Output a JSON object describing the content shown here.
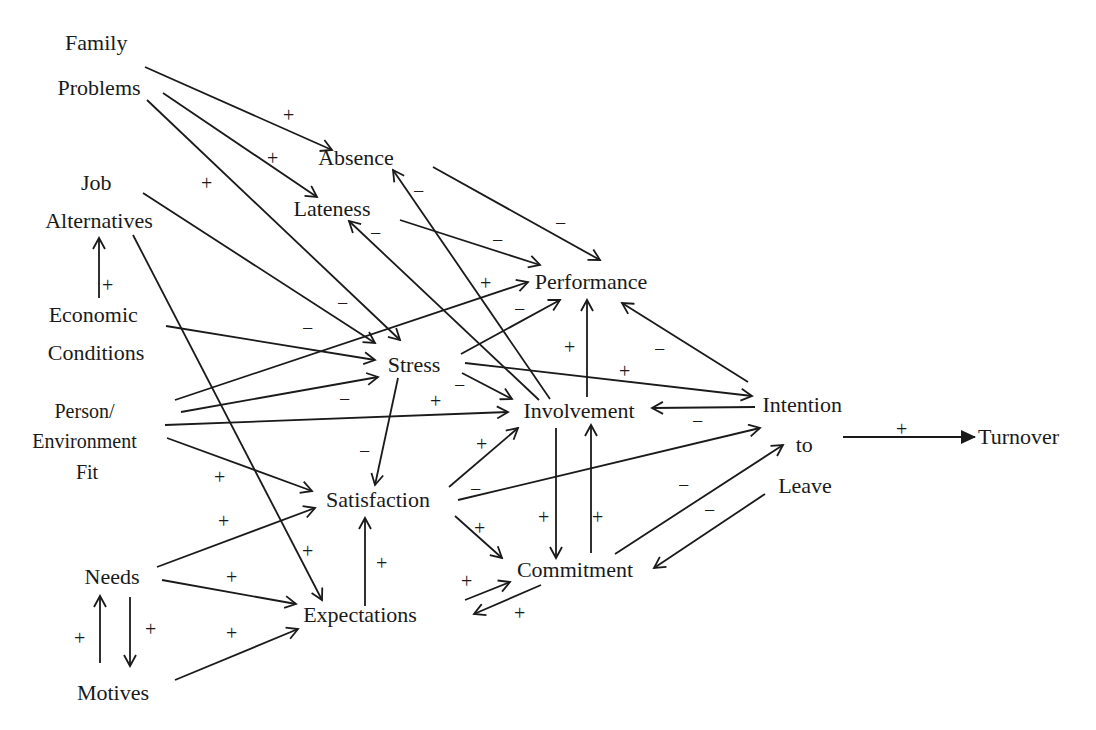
{
  "nodes": {
    "family_problems": {
      "lines": [
        "Family",
        "Problems"
      ]
    },
    "job_alternatives": {
      "lines": [
        "Job",
        "Alternatives"
      ]
    },
    "economic_conditions": {
      "lines": [
        "Economic",
        "Conditions"
      ]
    },
    "person_environment_fit": {
      "lines": [
        "Person/",
        "Environment",
        "Fit"
      ]
    },
    "needs": {
      "lines": [
        "Needs"
      ]
    },
    "motives": {
      "lines": [
        "Motives"
      ]
    },
    "absence": {
      "lines": [
        "Absence"
      ]
    },
    "lateness": {
      "lines": [
        "Lateness"
      ]
    },
    "performance": {
      "lines": [
        "Performance"
      ]
    },
    "stress": {
      "lines": [
        "Stress"
      ]
    },
    "involvement": {
      "lines": [
        "Involvement"
      ]
    },
    "satisfaction": {
      "lines": [
        "Satisfaction"
      ]
    },
    "commitment": {
      "lines": [
        "Commitment"
      ]
    },
    "expectations": {
      "lines": [
        "Expectations"
      ]
    },
    "intention_to_leave": {
      "lines": [
        "Intention",
        "to",
        "Leave"
      ]
    },
    "turnover": {
      "lines": [
        "Turnover"
      ]
    }
  },
  "edges": [
    {
      "from": "Family Problems",
      "to": "Absence",
      "sign": "+"
    },
    {
      "from": "Family Problems",
      "to": "Lateness",
      "sign": "+"
    },
    {
      "from": "Family Problems",
      "to": "Stress",
      "sign": "+"
    },
    {
      "from": "Job Alternatives",
      "to": "Stress",
      "sign": "−"
    },
    {
      "from": "Job Alternatives",
      "to": "Expectations",
      "sign": "+"
    },
    {
      "from": "Economic Conditions",
      "to": "Job Alternatives",
      "sign": "+"
    },
    {
      "from": "Economic Conditions",
      "to": "Stress",
      "sign": "−"
    },
    {
      "from": "Person/Environment Fit",
      "to": "Performance",
      "sign": "+"
    },
    {
      "from": "Person/Environment Fit",
      "to": "Stress",
      "sign": "−"
    },
    {
      "from": "Person/Environment Fit",
      "to": "Involvement",
      "sign": "+"
    },
    {
      "from": "Person/Environment Fit",
      "to": "Satisfaction",
      "sign": "+"
    },
    {
      "from": "Needs",
      "to": "Satisfaction",
      "sign": "+"
    },
    {
      "from": "Needs",
      "to": "Expectations",
      "sign": "+"
    },
    {
      "from": "Needs",
      "to": "Motives",
      "sign": "+"
    },
    {
      "from": "Motives",
      "to": "Needs",
      "sign": "+"
    },
    {
      "from": "Motives",
      "to": "Expectations",
      "sign": "+"
    },
    {
      "from": "Absence",
      "to": "Performance",
      "sign": "−"
    },
    {
      "from": "Lateness",
      "to": "Performance",
      "sign": "−"
    },
    {
      "from": "Stress",
      "to": "Performance",
      "sign": "−"
    },
    {
      "from": "Stress",
      "to": "Involvement",
      "sign": "−"
    },
    {
      "from": "Stress",
      "to": "Satisfaction",
      "sign": "−"
    },
    {
      "from": "Stress",
      "to": "Intention to Leave",
      "sign": "+"
    },
    {
      "from": "Involvement",
      "to": "Absence",
      "sign": "−"
    },
    {
      "from": "Involvement",
      "to": "Lateness",
      "sign": "−"
    },
    {
      "from": "Involvement",
      "to": "Performance",
      "sign": "+"
    },
    {
      "from": "Involvement",
      "to": "Commitment",
      "sign": "+"
    },
    {
      "from": "Satisfaction",
      "to": "Involvement",
      "sign": "+"
    },
    {
      "from": "Satisfaction",
      "to": "Commitment",
      "sign": "+"
    },
    {
      "from": "Satisfaction",
      "to": "Intention to Leave",
      "sign": "−"
    },
    {
      "from": "Expectations",
      "to": "Satisfaction",
      "sign": "+"
    },
    {
      "from": "Expectations",
      "to": "Commitment",
      "sign": "+"
    },
    {
      "from": "Commitment",
      "to": "Expectations",
      "sign": "+"
    },
    {
      "from": "Commitment",
      "to": "Involvement",
      "sign": "+"
    },
    {
      "from": "Commitment",
      "to": "Intention to Leave",
      "sign": "−"
    },
    {
      "from": "Intention to Leave",
      "to": "Performance",
      "sign": "−"
    },
    {
      "from": "Intention to Leave",
      "to": "Involvement",
      "sign": "−"
    },
    {
      "from": "Intention to Leave",
      "to": "Commitment",
      "sign": "−"
    },
    {
      "from": "Intention to Leave",
      "to": "Turnover",
      "sign": "+"
    }
  ],
  "signs": {
    "plus": "+",
    "minus": "−"
  }
}
